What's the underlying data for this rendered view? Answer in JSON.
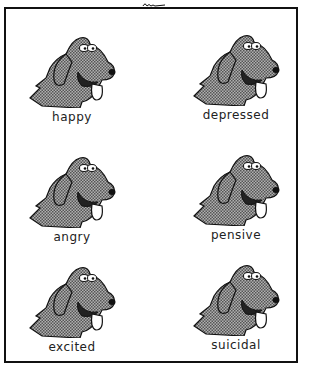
{
  "cartoon": {
    "signature": "Larson",
    "panels": [
      {
        "label": "happy"
      },
      {
        "label": "depressed"
      },
      {
        "label": "angry"
      },
      {
        "label": "pensive"
      },
      {
        "label": "excited"
      },
      {
        "label": "suicidal"
      }
    ],
    "colors": {
      "ink": "#111111",
      "fur": "#8a8a8a",
      "paper": "#ffffff"
    }
  }
}
